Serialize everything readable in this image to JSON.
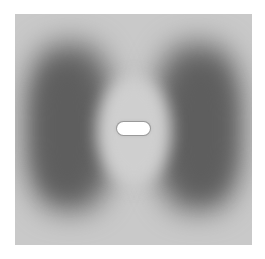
{
  "image": {
    "description": "Grayscale intensity pattern: two dark lobes left and right, bright elliptical region in the center with a white rounded slot",
    "colors": {
      "background": "#c9c9c9",
      "dark_lobes": "#5e5e5e",
      "center_region": "#cfcfcf",
      "slot": "#ffffff"
    }
  }
}
